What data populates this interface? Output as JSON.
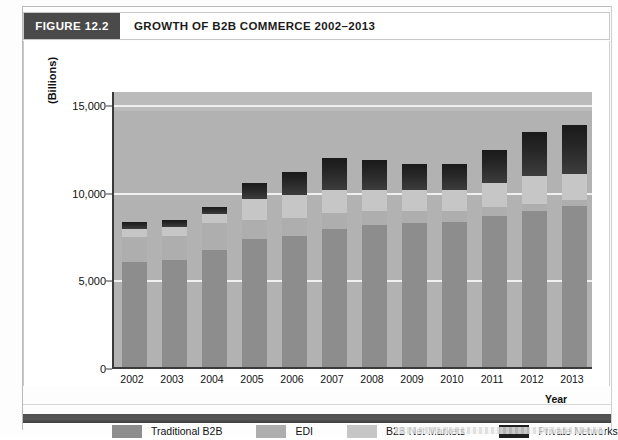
{
  "figure": {
    "tag": "FIGURE 12.2",
    "title": "GROWTH OF B2B COMMERCE 2002–2013"
  },
  "chart_data": {
    "type": "bar",
    "stacked": true,
    "title": "GROWTH OF B2B COMMERCE 2002–2013",
    "xlabel": "Year",
    "ylabel": "(Billions)",
    "ylim": [
      0,
      15800
    ],
    "yticks": [
      0,
      5000,
      10000,
      15000
    ],
    "ytick_labels": [
      "0",
      "5,000",
      "10,000",
      "15,000"
    ],
    "grid": true,
    "legend_position": "bottom",
    "categories": [
      "2002",
      "2003",
      "2004",
      "2005",
      "2006",
      "2007",
      "2008",
      "2009",
      "2010",
      "2011",
      "2012",
      "2013"
    ],
    "series": [
      {
        "name": "Traditional B2B",
        "color": "#8d8d8d",
        "values": [
          6000,
          6100,
          6700,
          7300,
          7500,
          7900,
          8100,
          8200,
          8300,
          8600,
          8900,
          9200
        ]
      },
      {
        "name": "EDI",
        "color": "#aeaeae",
        "values": [
          1400,
          1400,
          1500,
          1100,
          1000,
          900,
          800,
          700,
          600,
          500,
          400,
          300
        ]
      },
      {
        "name": "B2B Net Markets",
        "color": "#c6c6c6",
        "values": [
          500,
          500,
          500,
          1200,
          1300,
          1300,
          1200,
          1200,
          1200,
          1400,
          1600,
          1500
        ]
      },
      {
        "name": "Private Networks",
        "color": "#1f1f1f",
        "values": [
          400,
          400,
          400,
          900,
          1300,
          1800,
          1700,
          1500,
          1500,
          1900,
          2500,
          2800
        ]
      }
    ],
    "totals": [
      8300,
      8400,
      9100,
      10500,
      11100,
      11900,
      11800,
      11600,
      11600,
      12400,
      13400,
      13800
    ]
  },
  "legend": {
    "items": [
      {
        "label": "Traditional B2B",
        "color": "#8d8d8d"
      },
      {
        "label": "EDI",
        "color": "#aeaeae"
      },
      {
        "label": "B2B Net Markets",
        "color": "#c6c6c6"
      },
      {
        "label": "Private Networks",
        "color": "#1f1f1f"
      }
    ]
  }
}
